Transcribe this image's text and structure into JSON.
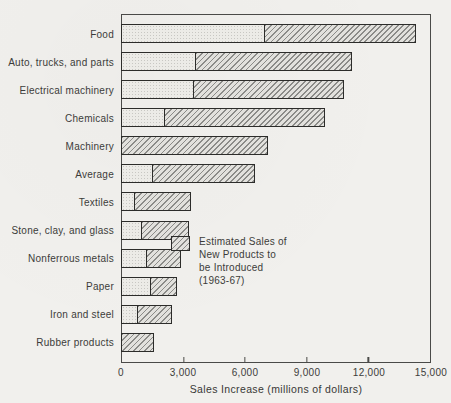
{
  "chart_data": {
    "type": "bar",
    "orientation": "horizontal",
    "stacked": true,
    "title": "",
    "xlabel": "Sales Increase (millions of dollars)",
    "ylabel": "",
    "xlim": [
      0,
      15000
    ],
    "x_ticks": [
      "0",
      "3,000",
      "6,000",
      "9,000",
      "12,000",
      "15,000"
    ],
    "x_tick_values": [
      0,
      3000,
      6000,
      9000,
      12000,
      15000
    ],
    "grid": false,
    "categories": [
      "Food",
      "Auto, trucks, and parts",
      "Electrical machinery",
      "Chemicals",
      "Machinery",
      "Average",
      "Textiles",
      "Stone, clay, and glass",
      "Nonferrous metals",
      "Paper",
      "Iron and steel",
      "Rubber products"
    ],
    "series": [
      {
        "name": "Existing products (stippled segment)",
        "values": [
          7000,
          3600,
          3500,
          2100,
          0,
          1500,
          650,
          1000,
          1250,
          1450,
          800,
          0
        ]
      },
      {
        "name": "Estimated Sales of New Products to be Introduced (1963-67)",
        "values": [
          7300,
          7600,
          7300,
          7800,
          7100,
          5000,
          2700,
          2250,
          1600,
          1250,
          1650,
          1550
        ]
      }
    ],
    "totals": [
      14300,
      11200,
      10800,
      9900,
      7100,
      6500,
      3350,
      3250,
      2850,
      2700,
      2450,
      1550
    ],
    "legend": {
      "position": "inside-right",
      "lines": [
        "Estimated Sales of",
        "New Products to",
        "be Introduced",
        "(1963-67)"
      ]
    },
    "colors": {
      "background": "#f1f0ed",
      "bar_border": "#2c2c2a",
      "stipple_fill": "#ecebe7",
      "stipple_dot": "#c8c7c3",
      "hatch_line": "#8b8b88",
      "hatch_fill": "#e2e1dd",
      "frame_border": "#4a4a48",
      "text": "#3c3c3a"
    }
  }
}
